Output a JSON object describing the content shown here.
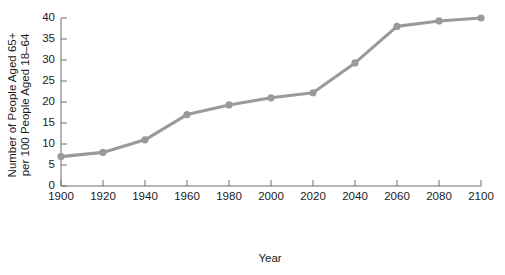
{
  "chart_data": {
    "type": "line",
    "title": "",
    "xlabel": "Year",
    "ylabel": "Number of People Aged 65+ per 100 People Aged 18–64",
    "ylabel_line1": "Number of People Aged 65+",
    "ylabel_line2": "per 100 People Aged 18–64",
    "x": [
      1900,
      1920,
      1940,
      1960,
      1980,
      2000,
      2020,
      2040,
      2060,
      2080,
      2100
    ],
    "values": [
      7,
      8,
      11,
      17,
      19.3,
      21,
      22.2,
      29.3,
      38,
      39.3,
      40
    ],
    "categories": [
      "1900",
      "1920",
      "1940",
      "1960",
      "1980",
      "2000",
      "2020",
      "2040",
      "2060",
      "2080",
      "2100"
    ],
    "xlim": [
      1900,
      2100
    ],
    "ylim": [
      0,
      40
    ],
    "xticks": [
      1900,
      1920,
      1940,
      1960,
      1980,
      2000,
      2020,
      2040,
      2060,
      2080,
      2100
    ],
    "xtick_labels": [
      "1900",
      "1920",
      "1940",
      "1960",
      "1980",
      "2000",
      "2020",
      "2040",
      "2060",
      "2080",
      "2100"
    ],
    "yticks": [
      0,
      5,
      10,
      15,
      20,
      25,
      30,
      35,
      40
    ],
    "ytick_labels": [
      "0",
      "5",
      "10",
      "15",
      "20",
      "25",
      "30",
      "35",
      "40"
    ],
    "grid": false,
    "legend": null,
    "legend_position": "none",
    "series_color": "#9a9a9a",
    "marker_color": "#9a9a9a",
    "axis_color": "#6e6e6e",
    "background_color": "#ffffff",
    "series": [
      {
        "name": "Old-age dependency ratio",
        "values": [
          7,
          8,
          11,
          17,
          19.3,
          21,
          22.2,
          29.3,
          38,
          39.3,
          40
        ]
      }
    ]
  }
}
